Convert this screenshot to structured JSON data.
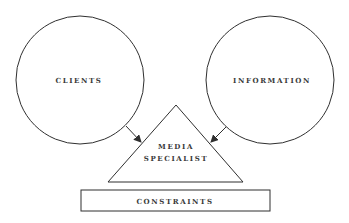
{
  "diagram": {
    "nodes": [
      {
        "id": "clients",
        "shape": "circle",
        "label": "CLIENTS"
      },
      {
        "id": "information",
        "shape": "circle",
        "label": "INFORMATION"
      },
      {
        "id": "media_specialist",
        "shape": "triangle",
        "label_line1": "MEDIA",
        "label_line2": "SPECIALIST"
      },
      {
        "id": "constraints",
        "shape": "rectangle",
        "label": "CONSTRAINTS"
      }
    ],
    "edges": [
      {
        "from": "clients",
        "to": "media_specialist",
        "type": "arrow"
      },
      {
        "from": "information",
        "to": "media_specialist",
        "type": "arrow"
      }
    ],
    "colors": {
      "stroke": "#2f2f2f",
      "text": "#3a3a3a",
      "background": "#ffffff"
    }
  }
}
